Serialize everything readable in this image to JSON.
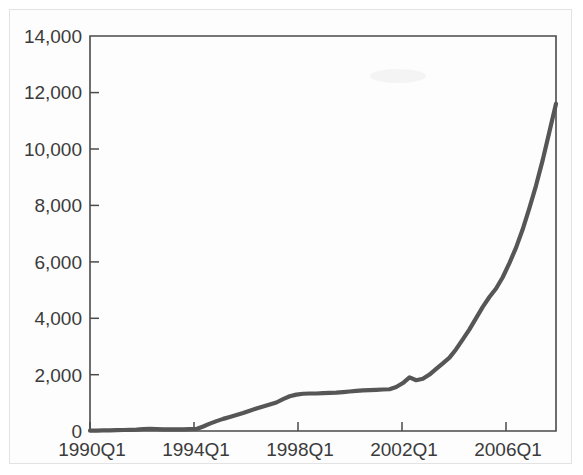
{
  "chart_data": {
    "type": "line",
    "title": "",
    "subtitle": "",
    "xlabel": "",
    "ylabel": "",
    "xlim": [
      "1990Q1",
      "2007Q3"
    ],
    "ylim": [
      0,
      14000
    ],
    "grid": false,
    "legend": null,
    "line_color": "#565656",
    "x_tick_labels": [
      "1990Q1",
      "1994Q1",
      "1998Q1",
      "2002Q1",
      "2006Q1"
    ],
    "y_tick_labels": [
      "0",
      "2,000",
      "4,000",
      "6,000",
      "8,000",
      "10,000",
      "12,000",
      "14,000"
    ],
    "y_tick_values": [
      0,
      2000,
      4000,
      6000,
      8000,
      10000,
      12000,
      14000
    ],
    "series": [
      {
        "name": "series-1",
        "x": [
          "1990Q1",
          "1990Q2",
          "1990Q3",
          "1990Q4",
          "1991Q1",
          "1991Q2",
          "1991Q3",
          "1991Q4",
          "1992Q1",
          "1992Q2",
          "1992Q3",
          "1992Q4",
          "1993Q1",
          "1993Q2",
          "1993Q3",
          "1993Q4",
          "1994Q1",
          "1994Q2",
          "1994Q3",
          "1994Q4",
          "1995Q1",
          "1995Q2",
          "1995Q3",
          "1995Q4",
          "1996Q1",
          "1996Q2",
          "1996Q3",
          "1996Q4",
          "1997Q1",
          "1997Q2",
          "1997Q3",
          "1997Q4",
          "1998Q1",
          "1998Q2",
          "1998Q3",
          "1998Q4",
          "1999Q1",
          "1999Q2",
          "1999Q3",
          "1999Q4",
          "2000Q1",
          "2000Q2",
          "2000Q3",
          "2000Q4",
          "2001Q1",
          "2001Q2",
          "2001Q3",
          "2001Q4",
          "2002Q1",
          "2002Q2",
          "2002Q3",
          "2002Q4",
          "2003Q1",
          "2003Q2",
          "2003Q3",
          "2003Q4",
          "2004Q1",
          "2004Q2",
          "2004Q3",
          "2004Q4",
          "2005Q1",
          "2005Q2",
          "2005Q3",
          "2005Q4",
          "2006Q1",
          "2006Q2",
          "2006Q3",
          "2006Q4",
          "2007Q1",
          "2007Q2",
          "2007Q3"
        ],
        "values": [
          10,
          15,
          20,
          25,
          30,
          35,
          40,
          50,
          70,
          80,
          70,
          60,
          55,
          55,
          60,
          65,
          70,
          160,
          260,
          350,
          430,
          500,
          570,
          640,
          720,
          800,
          870,
          940,
          1010,
          1130,
          1230,
          1290,
          1320,
          1330,
          1330,
          1340,
          1350,
          1360,
          1380,
          1400,
          1420,
          1440,
          1450,
          1460,
          1470,
          1480,
          1560,
          1700,
          1900,
          1800,
          1850,
          2000,
          2200,
          2400,
          2600,
          2900,
          3250,
          3600,
          4000,
          4400,
          4750,
          5050,
          5450,
          5950,
          6500,
          7150,
          7900,
          8700,
          9600,
          10600,
          11600
        ]
      }
    ]
  },
  "annotations": {
    "smudge_note": "faint-mark"
  }
}
